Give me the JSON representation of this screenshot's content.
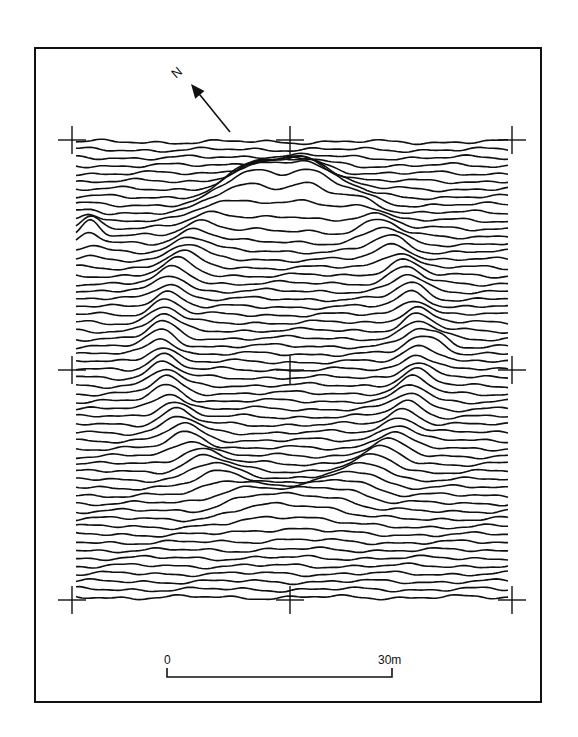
{
  "figure": {
    "type": "magnetometer-traceplot",
    "frame": {
      "x": 34,
      "y": 47,
      "w": 508,
      "h": 656
    },
    "colors": {
      "ink": "#111111",
      "paper": "#ffffff"
    }
  },
  "north_arrow": {
    "label": "N",
    "label_pos": {
      "x": 172,
      "y": 66
    },
    "tail": {
      "x": 230,
      "y": 132
    },
    "head": {
      "x": 191,
      "y": 84
    }
  },
  "grid": {
    "x": [
      72,
      290,
      512
    ],
    "y": [
      140,
      370,
      600
    ],
    "cross_arm": 14
  },
  "traces": {
    "count": 59,
    "x_start": 76,
    "x_end": 508,
    "y_start": 142,
    "spacing": 7.85,
    "anomalies": [
      {
        "name": "ring-enclosure",
        "cx": 290,
        "cy": 352,
        "rx": 128,
        "ry": 160,
        "amp": 16,
        "width": 13
      },
      {
        "name": "north-peak-left",
        "cx": 258,
        "cy": 205,
        "amp": 20,
        "sx": 22,
        "sy": 18
      },
      {
        "name": "north-peak-right",
        "cx": 306,
        "cy": 203,
        "amp": 22,
        "sx": 18,
        "sy": 18
      },
      {
        "name": "west-edge-spike",
        "cx": 90,
        "cy": 235,
        "amp": 16,
        "sx": 9,
        "sy": 12
      },
      {
        "name": "east-spike",
        "cx": 440,
        "cy": 352,
        "amp": 10,
        "sx": 10,
        "sy": 10
      }
    ]
  },
  "scale_bar": {
    "start_label": "0",
    "end_label": "30m",
    "x1": 167,
    "x2": 392,
    "y": 677,
    "tick_h": 9
  }
}
